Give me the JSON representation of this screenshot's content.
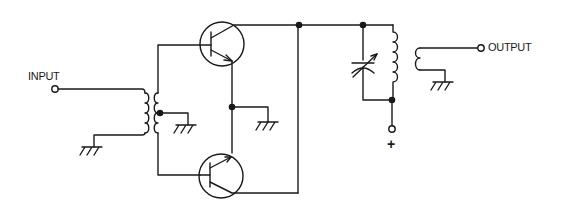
{
  "diagram": {
    "type": "circuit-schematic",
    "colors": {
      "line": "#1a1a1a",
      "background": "#ffffff"
    },
    "labels": {
      "input": "INPUT",
      "output": "OUTPUT",
      "supply": "+"
    },
    "components": [
      {
        "id": "input-terminal",
        "kind": "terminal",
        "label": "INPUT"
      },
      {
        "id": "input-transformer",
        "kind": "transformer",
        "note": "center-tapped secondary to ground"
      },
      {
        "id": "q1",
        "kind": "npn-transistor",
        "position": "top"
      },
      {
        "id": "q2",
        "kind": "npn-transistor",
        "position": "bottom"
      },
      {
        "id": "tank-capacitor",
        "kind": "variable-capacitor"
      },
      {
        "id": "tank-inductor",
        "kind": "inductor"
      },
      {
        "id": "output-coil",
        "kind": "coupling-coil"
      },
      {
        "id": "output-terminal",
        "kind": "terminal",
        "label": "OUTPUT"
      },
      {
        "id": "supply-terminal",
        "kind": "terminal",
        "label": "+"
      },
      {
        "id": "grounds",
        "kind": "ground",
        "count": 4
      }
    ]
  }
}
